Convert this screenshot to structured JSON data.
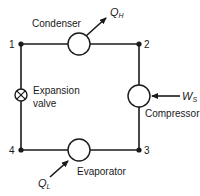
{
  "diagram": {
    "type": "refrigeration-cycle",
    "nodes": [
      {
        "id": "1",
        "label": "1"
      },
      {
        "id": "2",
        "label": "2"
      },
      {
        "id": "3",
        "label": "3"
      },
      {
        "id": "4",
        "label": "4"
      }
    ],
    "components": {
      "condenser": {
        "label": "Condenser"
      },
      "compressor": {
        "label": "Compressor"
      },
      "evaporator": {
        "label": "Evaporator"
      },
      "expansion_valve": {
        "label_line1": "Expansion",
        "label_line2": "valve"
      }
    },
    "flows": {
      "heat_out": {
        "symbol": "Q",
        "subscript": "H"
      },
      "work_in": {
        "symbol": "W",
        "subscript": "S"
      },
      "heat_in": {
        "symbol": "Q",
        "subscript": "L"
      }
    },
    "colors": {
      "line": "#1a1a1a",
      "background": "#ffffff"
    }
  }
}
